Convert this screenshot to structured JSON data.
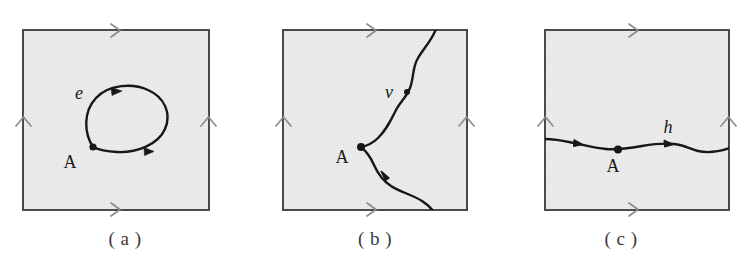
{
  "figure": {
    "width": 745,
    "height": 277,
    "background_color": "#ffffff",
    "square_fill_color": "#e9e9e9",
    "square_border_color": "#4a4a4a",
    "edge_arrow_color": "#8c8c8c",
    "curve_color": "#171717",
    "label_color": "#1a1a1a"
  },
  "panels": [
    {
      "id": "a",
      "caption": "( a )",
      "square": {
        "x": 23,
        "y": 30,
        "width": 186,
        "height": 180
      },
      "edge_arrows": [
        {
          "name": "top-edge-arrow",
          "glyph": "chevron-right",
          "direction": "right"
        },
        {
          "name": "bottom-edge-arrow",
          "glyph": "chevron-right",
          "direction": "right"
        },
        {
          "name": "left-edge-arrow",
          "glyph": "chevron-up",
          "direction": "up"
        },
        {
          "name": "right-edge-arrow",
          "glyph": "chevron-up",
          "direction": "up"
        }
      ],
      "curve_kind": "closed-loop",
      "curve_label": "e",
      "curve_label_style": "italic",
      "base_point_label": "A",
      "marker_count": 2
    },
    {
      "id": "b",
      "caption": "( b )",
      "square": {
        "x": 283,
        "y": 30,
        "width": 184,
        "height": 180
      },
      "edge_arrows": [
        {
          "name": "top-edge-arrow",
          "glyph": "chevron-right",
          "direction": "right"
        },
        {
          "name": "bottom-edge-arrow",
          "glyph": "chevron-right",
          "direction": "right"
        },
        {
          "name": "left-edge-arrow",
          "glyph": "chevron-up",
          "direction": "up"
        },
        {
          "name": "right-edge-arrow",
          "glyph": "chevron-up",
          "direction": "up"
        }
      ],
      "curve_kind": "vertical-wavy-curve",
      "curve_label": "v",
      "curve_label_style": "italic",
      "base_point_label": "A",
      "marker_count": 2
    },
    {
      "id": "c",
      "caption": "( c )",
      "square": {
        "x": 49,
        "y": 30,
        "width": 184,
        "height": 180
      },
      "edge_arrows": [
        {
          "name": "top-edge-arrow",
          "glyph": "chevron-right",
          "direction": "right"
        },
        {
          "name": "bottom-edge-arrow",
          "glyph": "chevron-right",
          "direction": "right"
        },
        {
          "name": "left-edge-arrow",
          "glyph": "chevron-up",
          "direction": "up"
        },
        {
          "name": "right-edge-arrow",
          "glyph": "chevron-up",
          "direction": "up"
        }
      ],
      "curve_kind": "horizontal-wavy-curve",
      "curve_label": "h",
      "curve_label_style": "italic",
      "base_point_label": "A",
      "marker_count": 2
    }
  ]
}
